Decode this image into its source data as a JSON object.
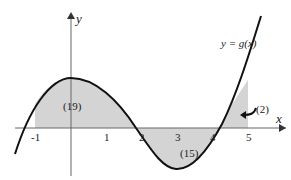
{
  "diagram": {
    "function_label": "y = g(x)",
    "axis_x_label": "x",
    "axis_y_label": "y",
    "x_ticks": [
      "-1",
      "1",
      "2",
      "3",
      "4",
      "5"
    ],
    "regions": [
      {
        "label": "(19)",
        "from": -1,
        "to": 1.7,
        "sign": "positive"
      },
      {
        "label": "(15)",
        "from": 1.7,
        "to": 4.5,
        "sign": "negative"
      },
      {
        "label": "(2)",
        "from": 4.5,
        "to": 5,
        "sign": "positive"
      }
    ],
    "colors": {
      "shade": "#d4d4d4",
      "curve": "#111111",
      "axis": "#555555"
    }
  }
}
